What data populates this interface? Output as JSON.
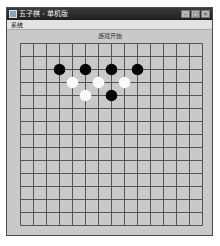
{
  "window": {
    "title": "五子棋 - 单机版",
    "controls": {
      "minimize": "–",
      "maximize": "□",
      "close": "×"
    }
  },
  "menu": {
    "items": [
      {
        "label": "系统"
      }
    ]
  },
  "status": {
    "text": "游戏开始"
  },
  "board": {
    "size": 15,
    "cell_px": 13,
    "line_color": "#555555",
    "background": "#c9c9c9",
    "stones": [
      {
        "row": 2,
        "col": 3,
        "color": "black"
      },
      {
        "row": 2,
        "col": 5,
        "color": "black"
      },
      {
        "row": 2,
        "col": 7,
        "color": "black"
      },
      {
        "row": 2,
        "col": 9,
        "color": "black"
      },
      {
        "row": 3,
        "col": 4,
        "color": "white"
      },
      {
        "row": 3,
        "col": 6,
        "color": "white"
      },
      {
        "row": 3,
        "col": 8,
        "color": "white"
      },
      {
        "row": 4,
        "col": 5,
        "color": "white"
      },
      {
        "row": 4,
        "col": 7,
        "color": "black"
      }
    ]
  }
}
